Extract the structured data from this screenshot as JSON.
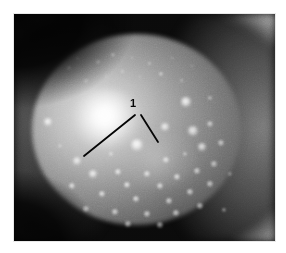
{
  "figure": {
    "kind": "ophthalmic-photograph",
    "modality_description": "Grayscale slit-lamp retroillumination photograph of the anterior eye",
    "background_color": "#ffffff",
    "photo_border_color": "#e8e8e8",
    "photo_base_color": "#030303",
    "annotation_color": "#050505",
    "highlight_color": "#ffffff",
    "annotations": {
      "labels": [
        {
          "text": "1",
          "x": 116,
          "y": 84,
          "leader_lines": [
            {
              "x1": 121,
              "y1": 101,
              "x2": 70,
              "y2": 142
            },
            {
              "x1": 127,
              "y1": 101,
              "x2": 144,
              "y2": 128
            }
          ]
        }
      ]
    },
    "deposits": [
      {
        "x": 34,
        "y": 108,
        "r": 4.2,
        "o": 0.95
      },
      {
        "x": 55,
        "y": 54,
        "r": 2.0,
        "o": 0.8
      },
      {
        "x": 63,
        "y": 44,
        "r": 1.5,
        "o": 0.7
      },
      {
        "x": 72,
        "y": 67,
        "r": 1.6,
        "o": 0.72
      },
      {
        "x": 84,
        "y": 48,
        "r": 1.8,
        "o": 0.75
      },
      {
        "x": 92,
        "y": 62,
        "r": 1.4,
        "o": 0.62
      },
      {
        "x": 99,
        "y": 41,
        "r": 1.6,
        "o": 0.66
      },
      {
        "x": 108,
        "y": 57,
        "r": 1.5,
        "o": 0.6
      },
      {
        "x": 118,
        "y": 44,
        "r": 1.4,
        "o": 0.58
      },
      {
        "x": 126,
        "y": 63,
        "r": 1.4,
        "o": 0.56
      },
      {
        "x": 135,
        "y": 49,
        "r": 1.5,
        "o": 0.6
      },
      {
        "x": 147,
        "y": 60,
        "r": 1.6,
        "o": 0.62
      },
      {
        "x": 158,
        "y": 44,
        "r": 1.4,
        "o": 0.56
      },
      {
        "x": 167,
        "y": 66,
        "r": 1.5,
        "o": 0.54
      },
      {
        "x": 178,
        "y": 52,
        "r": 1.3,
        "o": 0.48
      },
      {
        "x": 172,
        "y": 88,
        "r": 4.6,
        "o": 0.92
      },
      {
        "x": 196,
        "y": 84,
        "r": 2.2,
        "o": 0.58
      },
      {
        "x": 151,
        "y": 113,
        "r": 4.0,
        "o": 0.88
      },
      {
        "x": 179,
        "y": 117,
        "r": 4.6,
        "o": 0.82
      },
      {
        "x": 196,
        "y": 110,
        "r": 3.2,
        "o": 0.62
      },
      {
        "x": 123,
        "y": 131,
        "r": 5.6,
        "o": 0.95
      },
      {
        "x": 97,
        "y": 140,
        "r": 2.4,
        "o": 0.7
      },
      {
        "x": 152,
        "y": 146,
        "r": 2.8,
        "o": 0.74
      },
      {
        "x": 171,
        "y": 140,
        "r": 2.4,
        "o": 0.62
      },
      {
        "x": 188,
        "y": 133,
        "r": 4.4,
        "o": 0.82
      },
      {
        "x": 207,
        "y": 129,
        "r": 3.0,
        "o": 0.62
      },
      {
        "x": 63,
        "y": 147,
        "r": 3.8,
        "o": 0.86
      },
      {
        "x": 79,
        "y": 160,
        "r": 4.4,
        "o": 0.9
      },
      {
        "x": 104,
        "y": 158,
        "r": 3.2,
        "o": 0.8
      },
      {
        "x": 133,
        "y": 160,
        "r": 3.0,
        "o": 0.76
      },
      {
        "x": 113,
        "y": 171,
        "r": 3.4,
        "o": 0.8
      },
      {
        "x": 146,
        "y": 172,
        "r": 3.0,
        "o": 0.74
      },
      {
        "x": 163,
        "y": 163,
        "r": 3.4,
        "o": 0.76
      },
      {
        "x": 183,
        "y": 157,
        "r": 3.0,
        "o": 0.68
      },
      {
        "x": 200,
        "y": 150,
        "r": 2.6,
        "o": 0.6
      },
      {
        "x": 58,
        "y": 172,
        "r": 3.0,
        "o": 0.74
      },
      {
        "x": 88,
        "y": 180,
        "r": 3.4,
        "o": 0.78
      },
      {
        "x": 122,
        "y": 185,
        "r": 3.4,
        "o": 0.76
      },
      {
        "x": 155,
        "y": 187,
        "r": 3.0,
        "o": 0.7
      },
      {
        "x": 176,
        "y": 178,
        "r": 3.0,
        "o": 0.68
      },
      {
        "x": 196,
        "y": 170,
        "r": 2.8,
        "o": 0.62
      },
      {
        "x": 72,
        "y": 195,
        "r": 3.0,
        "o": 0.68
      },
      {
        "x": 101,
        "y": 198,
        "r": 3.2,
        "o": 0.7
      },
      {
        "x": 133,
        "y": 200,
        "r": 3.2,
        "o": 0.68
      },
      {
        "x": 162,
        "y": 199,
        "r": 3.0,
        "o": 0.64
      },
      {
        "x": 186,
        "y": 192,
        "r": 2.8,
        "o": 0.6
      },
      {
        "x": 114,
        "y": 210,
        "r": 2.8,
        "o": 0.58
      },
      {
        "x": 146,
        "y": 211,
        "r": 2.6,
        "o": 0.54
      },
      {
        "x": 90,
        "y": 120,
        "r": 1.6,
        "o": 0.5
      },
      {
        "x": 210,
        "y": 196,
        "r": 2.2,
        "o": 0.48
      },
      {
        "x": 46,
        "y": 132,
        "r": 1.8,
        "o": 0.48
      },
      {
        "x": 216,
        "y": 160,
        "r": 2.0,
        "o": 0.4
      }
    ]
  }
}
